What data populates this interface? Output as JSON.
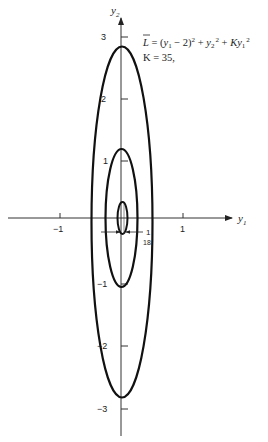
{
  "figure": {
    "axes": {
      "x_label": "y",
      "x_label_sub": "1",
      "y_label": "y",
      "y_label_sub": "2",
      "x_ticks": [
        {
          "value": -1,
          "label": "−1"
        },
        {
          "value": 1,
          "label": "1"
        }
      ],
      "y_ticks": [
        {
          "value": 3,
          "label": "3"
        },
        {
          "value": 2,
          "label": "2"
        },
        {
          "value": 1,
          "label": "1"
        },
        {
          "value": -1,
          "label": "−1"
        },
        {
          "value": -2,
          "label": "−2"
        },
        {
          "value": -3,
          "label": "−3"
        }
      ]
    },
    "equation": {
      "lhs": "L",
      "rhs_part1": "= (",
      "y1": "y",
      "sub1": "1",
      "minus2": " − 2)",
      "sq1": "2",
      "plus1": " + ",
      "y2": "y",
      "sub2": "2",
      "sq2": "2",
      "plus2": " + ",
      "K": "Ky",
      "sub3": "1",
      "sq3": "2",
      "k_line": "K = 35,"
    },
    "annotation": {
      "numerator": "1",
      "denominator": "18"
    },
    "contours": [
      {
        "name": "outer",
        "center_y1": 0.0556,
        "semi_axis_y1": 0.49,
        "semi_axis_y2": 2.83
      },
      {
        "name": "middle",
        "center_y1": 0.0556,
        "semi_axis_y1": 0.26,
        "semi_axis_y2": 1.11
      },
      {
        "name": "inner",
        "center_y1": 0.0556,
        "semi_axis_y1": 0.08,
        "semi_axis_y2": 0.26
      }
    ]
  }
}
